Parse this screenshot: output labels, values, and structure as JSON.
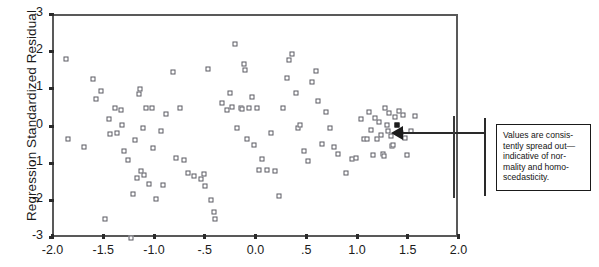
{
  "chart_data": {
    "type": "scatter",
    "title": "",
    "xlabel": "",
    "ylabel": "Regression Standardized Residual",
    "xlim": [
      -2.0,
      2.0
    ],
    "ylim": [
      -3,
      3
    ],
    "grid": false,
    "legend": null,
    "xticklabels": [
      "-2.0",
      "-1.5",
      "-1.0",
      "-.5",
      "0.0",
      ".5",
      "1.0",
      "1.5",
      "2.0"
    ],
    "xtickvalues": [
      -2.0,
      -1.5,
      -1.0,
      -0.5,
      0.0,
      0.5,
      1.0,
      1.5,
      2.0
    ],
    "yticklabels": [
      "3",
      "2",
      "1",
      "0",
      "-1",
      "-2",
      "-3"
    ],
    "ytickvalues": [
      3,
      2,
      1,
      0,
      -1,
      -2,
      -3
    ],
    "marker": "open-square",
    "points": [
      {
        "x": -1.88,
        "y": 1.84
      },
      {
        "x": -1.86,
        "y": -0.32
      },
      {
        "x": -1.7,
        "y": -0.52
      },
      {
        "x": -1.62,
        "y": 1.3
      },
      {
        "x": -1.59,
        "y": 0.78
      },
      {
        "x": -1.54,
        "y": 0.98
      },
      {
        "x": -1.5,
        "y": -2.45
      },
      {
        "x": -1.46,
        "y": 0.22
      },
      {
        "x": -1.45,
        "y": -0.18
      },
      {
        "x": -1.4,
        "y": 0.52
      },
      {
        "x": -1.38,
        "y": -0.14
      },
      {
        "x": -1.34,
        "y": 0.46
      },
      {
        "x": -1.33,
        "y": 0.08
      },
      {
        "x": -1.31,
        "y": -0.62
      },
      {
        "x": -1.27,
        "y": -0.88
      },
      {
        "x": -1.24,
        "y": -2.96
      },
      {
        "x": -1.22,
        "y": -1.8
      },
      {
        "x": -1.2,
        "y": -0.34
      },
      {
        "x": -1.18,
        "y": -1.36
      },
      {
        "x": -1.16,
        "y": 0.9
      },
      {
        "x": -1.15,
        "y": 1.03
      },
      {
        "x": -1.14,
        "y": -1.18
      },
      {
        "x": -1.12,
        "y": 0.0
      },
      {
        "x": -1.11,
        "y": -1.28
      },
      {
        "x": -1.09,
        "y": 0.52
      },
      {
        "x": -1.06,
        "y": -1.52
      },
      {
        "x": -1.03,
        "y": 0.52
      },
      {
        "x": -1.02,
        "y": -0.54
      },
      {
        "x": -1.0,
        "y": -1.92
      },
      {
        "x": -0.95,
        "y": -0.1
      },
      {
        "x": -0.93,
        "y": -1.56
      },
      {
        "x": -0.9,
        "y": 0.37
      },
      {
        "x": -0.83,
        "y": 1.48
      },
      {
        "x": -0.8,
        "y": -0.82
      },
      {
        "x": -0.76,
        "y": 0.52
      },
      {
        "x": -0.72,
        "y": -0.88
      },
      {
        "x": -0.68,
        "y": -1.22
      },
      {
        "x": -0.62,
        "y": -1.3
      },
      {
        "x": -0.55,
        "y": -1.38
      },
      {
        "x": -0.52,
        "y": -1.25
      },
      {
        "x": -0.51,
        "y": -1.58
      },
      {
        "x": -0.48,
        "y": 1.58
      },
      {
        "x": -0.45,
        "y": -1.94
      },
      {
        "x": -0.42,
        "y": -2.28
      },
      {
        "x": -0.41,
        "y": -2.45
      },
      {
        "x": -0.34,
        "y": 0.66
      },
      {
        "x": -0.3,
        "y": 0.48
      },
      {
        "x": -0.27,
        "y": 0.92
      },
      {
        "x": -0.25,
        "y": 0.56
      },
      {
        "x": -0.22,
        "y": 2.24
      },
      {
        "x": -0.2,
        "y": -0.02
      },
      {
        "x": -0.16,
        "y": 0.52
      },
      {
        "x": -0.15,
        "y": 0.5
      },
      {
        "x": -0.13,
        "y": 1.72
      },
      {
        "x": -0.12,
        "y": 1.55
      },
      {
        "x": -0.1,
        "y": -0.3
      },
      {
        "x": -0.08,
        "y": 0.52
      },
      {
        "x": -0.05,
        "y": 0.82
      },
      {
        "x": -0.03,
        "y": -0.48
      },
      {
        "x": 0.0,
        "y": 0.52
      },
      {
        "x": 0.02,
        "y": -1.14
      },
      {
        "x": 0.05,
        "y": -0.86
      },
      {
        "x": 0.1,
        "y": -1.14
      },
      {
        "x": 0.14,
        "y": -0.16
      },
      {
        "x": 0.18,
        "y": -1.16
      },
      {
        "x": 0.22,
        "y": -1.84
      },
      {
        "x": 0.26,
        "y": 0.52
      },
      {
        "x": 0.3,
        "y": 1.34
      },
      {
        "x": 0.32,
        "y": 1.82
      },
      {
        "x": 0.34,
        "y": 1.97
      },
      {
        "x": 0.38,
        "y": 0.92
      },
      {
        "x": 0.4,
        "y": -0.02
      },
      {
        "x": 0.42,
        "y": 0.08
      },
      {
        "x": 0.46,
        "y": -0.62
      },
      {
        "x": 0.5,
        "y": -0.9
      },
      {
        "x": 0.54,
        "y": 1.22
      },
      {
        "x": 0.58,
        "y": 1.53
      },
      {
        "x": 0.6,
        "y": 0.72
      },
      {
        "x": 0.64,
        "y": -0.44
      },
      {
        "x": 0.68,
        "y": 0.42
      },
      {
        "x": 0.72,
        "y": -0.02
      },
      {
        "x": 0.76,
        "y": -0.52
      },
      {
        "x": 0.8,
        "y": -0.7
      },
      {
        "x": 0.88,
        "y": -1.22
      },
      {
        "x": 0.94,
        "y": -0.84
      },
      {
        "x": 0.98,
        "y": -0.82
      },
      {
        "x": 1.02,
        "y": 0.22
      },
      {
        "x": 1.05,
        "y": -0.3
      },
      {
        "x": 1.08,
        "y": -0.32
      },
      {
        "x": 1.1,
        "y": 0.42
      },
      {
        "x": 1.12,
        "y": -0.06
      },
      {
        "x": 1.14,
        "y": -0.74
      },
      {
        "x": 1.16,
        "y": 0.26
      },
      {
        "x": 1.18,
        "y": -0.3
      },
      {
        "x": 1.2,
        "y": 0.16
      },
      {
        "x": 1.22,
        "y": -0.2
      },
      {
        "x": 1.24,
        "y": -0.72
      },
      {
        "x": 1.25,
        "y": -0.76
      },
      {
        "x": 1.26,
        "y": 0.52
      },
      {
        "x": 1.28,
        "y": 0.08
      },
      {
        "x": 1.29,
        "y": -0.1
      },
      {
        "x": 1.3,
        "y": 0.4
      },
      {
        "x": 1.32,
        "y": -0.24
      },
      {
        "x": 1.33,
        "y": -0.5
      },
      {
        "x": 1.34,
        "y": -0.48
      },
      {
        "x": 1.36,
        "y": 0.28
      },
      {
        "x": 1.38,
        "y": 0.06,
        "filled": true
      },
      {
        "x": 1.4,
        "y": 0.44
      },
      {
        "x": 1.42,
        "y": -0.16
      },
      {
        "x": 1.44,
        "y": 0.34
      },
      {
        "x": 1.46,
        "y": -0.28
      },
      {
        "x": 1.48,
        "y": -0.74
      },
      {
        "x": 1.52,
        "y": -0.1
      },
      {
        "x": 1.56,
        "y": 0.3
      }
    ],
    "annotations": [
      {
        "name": "callout",
        "text": "Values are consistently spread out—indicative of normality and homoscedasticity.",
        "points_to": {
          "x": 1.38,
          "y": 0.06
        }
      }
    ]
  },
  "callout": {
    "line1": "Values are consis-",
    "line2": "tently spread out—",
    "line3": "indicative of nor-",
    "line4": "mality and homo-",
    "line5": "scedasticity."
  },
  "colors": {
    "marker_edge": "#5a5a62",
    "axis": "#595959",
    "text": "#1b1b1b",
    "annotation_border": "#1a1a1a",
    "arrow": "#1c1c1c"
  }
}
